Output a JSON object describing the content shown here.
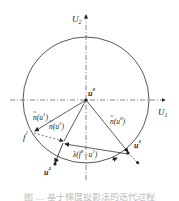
{
  "diagram": {
    "type": "gradient-projection-on-circle",
    "axes": {
      "x_label": "U",
      "x_sub": "1",
      "y_label": "U",
      "y_sub": "2"
    },
    "points": {
      "u0": {
        "label": "u",
        "sup": "0"
      },
      "u1": {
        "label": "u",
        "sup": "1"
      },
      "u2": {
        "label": "u",
        "sup": "2"
      },
      "f1": {
        "label": "f",
        "sup": "1"
      }
    },
    "vectors": {
      "n_u0": {
        "label": "n(u",
        "sup": "0",
        "close": ")"
      },
      "n_u1": {
        "label": "n(u",
        "sup": "1",
        "close": ")"
      },
      "n_u2": {
        "label": "n(u",
        "sup": "2",
        "close": ")"
      },
      "lambda": {
        "label": "λ(f",
        "sup1": "0",
        "mid": "−u",
        "sup2": "1",
        "close": ")"
      }
    },
    "caption": "图 … 基于梯度投影法的迭代过程"
  },
  "colors": {
    "line": "#333333",
    "axis": "#555555",
    "background": "#ffffff"
  }
}
